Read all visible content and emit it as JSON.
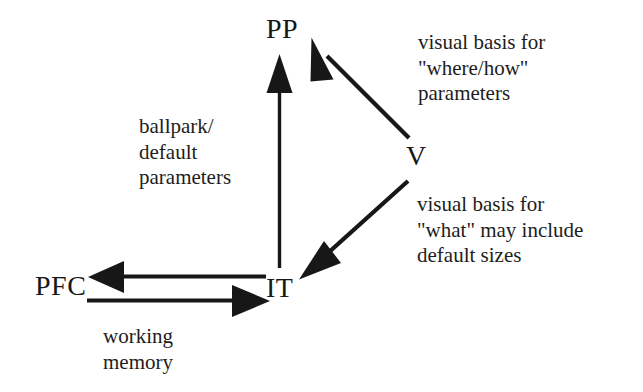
{
  "diagram": {
    "background_color": "#ffffff",
    "ink_color": "#171717",
    "nodes": [
      {
        "id": "PP",
        "label": "PP"
      },
      {
        "id": "V",
        "label": "V"
      },
      {
        "id": "IT",
        "label": "IT"
      },
      {
        "id": "PFC",
        "label": "PFC"
      }
    ],
    "edges": [
      {
        "id": "it-to-pp",
        "from": "IT",
        "to": "PP",
        "direction": "up",
        "caption": "ballpark/\ndefault\nparameters"
      },
      {
        "id": "v-to-pp",
        "from": "V",
        "to": "PP",
        "direction": "up-left",
        "caption": "visual basis for\n\"where/how\"\nparameters"
      },
      {
        "id": "v-to-it",
        "from": "V",
        "to": "IT",
        "direction": "down-left",
        "caption": "visual basis for\n\"what\" may include\ndefault sizes"
      },
      {
        "id": "it-to-pfc",
        "from": "IT",
        "to": "PFC",
        "direction": "left",
        "caption": ""
      },
      {
        "id": "pfc-to-it",
        "from": "PFC",
        "to": "IT",
        "direction": "right",
        "caption": "working\nmemory"
      }
    ],
    "captions": {
      "ballpark_parameters": "ballpark/\ndefault\nparameters",
      "where_how": "visual basis for\n\"where/how\"\nparameters",
      "what_sizes": "visual basis for\n\"what\" may include\ndefault sizes",
      "working_memory": "working\nmemory"
    }
  }
}
